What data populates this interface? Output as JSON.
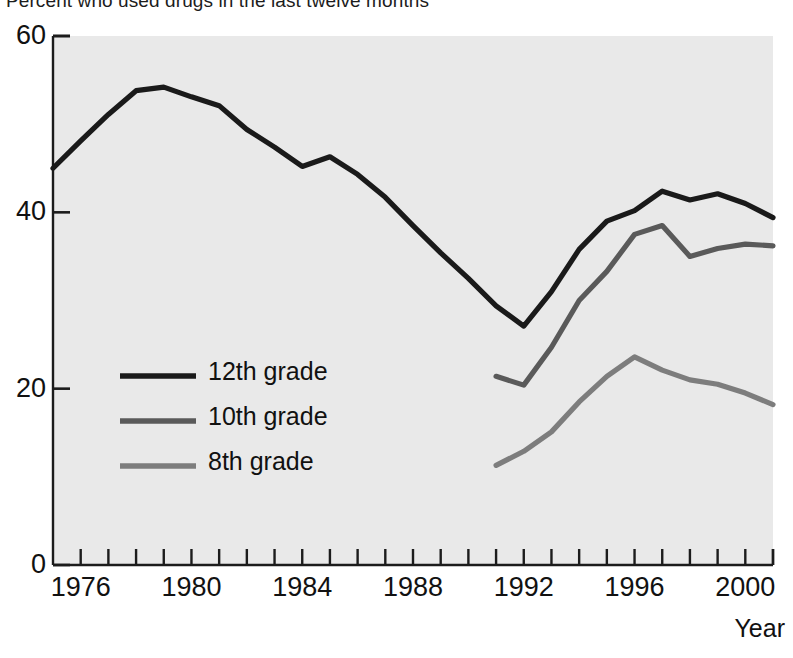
{
  "chart_data": {
    "type": "line",
    "title": "Percent who used drugs in the last twelve months",
    "xlabel": "Year",
    "ylabel": "",
    "xlim": [
      1975,
      2001
    ],
    "ylim": [
      0,
      60
    ],
    "yticks": [
      "0",
      "20",
      "40",
      "60"
    ],
    "ytick_values": [
      0,
      20,
      40,
      60
    ],
    "xticks": [
      "1976",
      "1980",
      "1984",
      "1988",
      "1992",
      "1996",
      "2000"
    ],
    "xtick_values": [
      1976,
      1980,
      1984,
      1988,
      1992,
      1996,
      2000
    ],
    "minor_xticks": [
      1975,
      1976,
      1977,
      1978,
      1979,
      1980,
      1981,
      1982,
      1983,
      1984,
      1985,
      1986,
      1987,
      1988,
      1989,
      1990,
      1991,
      1992,
      1993,
      1994,
      1995,
      1996,
      1997,
      1998,
      1999,
      2000,
      2001
    ],
    "grid": false,
    "legend_position": "center-left",
    "plot_background": "#ebebeb",
    "series": [
      {
        "name": "12th grade",
        "color": "#1a1a1a",
        "x": [
          1975,
          1976,
          1977,
          1978,
          1979,
          1980,
          1981,
          1982,
          1983,
          1984,
          1985,
          1986,
          1987,
          1988,
          1989,
          1990,
          1991,
          1992,
          1993,
          1994,
          1995,
          1996,
          1997,
          1998,
          1999,
          2000,
          2001
        ],
        "values": [
          45.0,
          48.1,
          51.1,
          53.8,
          54.2,
          53.1,
          52.1,
          49.4,
          47.4,
          45.2,
          46.3,
          44.3,
          41.7,
          38.5,
          35.4,
          32.5,
          29.4,
          27.1,
          31.0,
          35.8,
          39.0,
          40.2,
          42.4,
          41.4,
          42.1,
          41.0,
          39.4
        ]
      },
      {
        "name": "10th grade",
        "color": "#5a5a5a",
        "x": [
          1991,
          1992,
          1993,
          1994,
          1995,
          1996,
          1997,
          1998,
          1999,
          2000,
          2001
        ],
        "values": [
          21.4,
          20.4,
          24.7,
          30.0,
          33.3,
          37.5,
          38.5,
          35.0,
          35.9,
          36.4,
          36.2
        ]
      },
      {
        "name": "8th grade",
        "color": "#7d7d7d",
        "x": [
          1991,
          1992,
          1993,
          1994,
          1995,
          1996,
          1997,
          1998,
          1999,
          2000,
          2001
        ],
        "values": [
          11.3,
          12.9,
          15.1,
          18.5,
          21.4,
          23.6,
          22.1,
          21.0,
          20.5,
          19.5,
          18.2
        ]
      }
    ]
  },
  "legend": {
    "items": [
      {
        "label": "12th grade",
        "color": "#1a1a1a"
      },
      {
        "label": "10th grade",
        "color": "#5a5a5a"
      },
      {
        "label": "8th grade",
        "color": "#7d7d7d"
      }
    ]
  },
  "axes": {
    "x_axis_title": "Year"
  }
}
